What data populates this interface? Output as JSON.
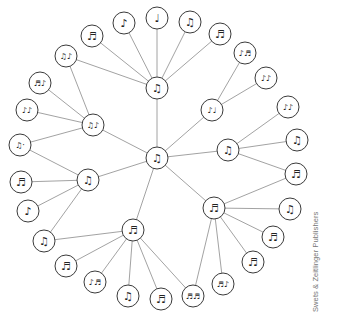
{
  "diagram": {
    "node_radius": 11,
    "colors": {
      "edge": "#8a8a8a",
      "node_stroke": "#3a3a3a",
      "node_fill": "#ffffff",
      "watermark": "#777777"
    },
    "nodes": [
      {
        "id": "C",
        "x": 157,
        "y": 158,
        "glyph": "♫",
        "role": "hub"
      },
      {
        "id": "T",
        "x": 157,
        "y": 88,
        "glyph": "♫",
        "role": "hub"
      },
      {
        "id": "L",
        "x": 93,
        "y": 125,
        "glyph": "♫♪",
        "role": "hub"
      },
      {
        "id": "LL",
        "x": 88,
        "y": 180,
        "glyph": "♫",
        "role": "hub"
      },
      {
        "id": "B",
        "x": 133,
        "y": 230,
        "glyph": "♬",
        "role": "hub"
      },
      {
        "id": "BR",
        "x": 214,
        "y": 208,
        "glyph": "♬",
        "role": "hub"
      },
      {
        "id": "R",
        "x": 228,
        "y": 150,
        "glyph": "♫",
        "role": "hub"
      },
      {
        "id": "UR",
        "x": 212,
        "y": 110,
        "glyph": "♪♩",
        "role": "hub"
      },
      {
        "id": "t1",
        "x": 92,
        "y": 36,
        "glyph": "♬",
        "role": "leaf"
      },
      {
        "id": "t2",
        "x": 124,
        "y": 23,
        "glyph": "♪",
        "role": "leaf"
      },
      {
        "id": "t3",
        "x": 157,
        "y": 18,
        "glyph": "♩",
        "role": "leaf"
      },
      {
        "id": "t4",
        "x": 190,
        "y": 22,
        "glyph": "♫",
        "role": "leaf"
      },
      {
        "id": "t5",
        "x": 220,
        "y": 34,
        "glyph": "♬",
        "role": "leaf"
      },
      {
        "id": "tl",
        "x": 66,
        "y": 56,
        "glyph": "♫♪",
        "role": "leaf"
      },
      {
        "id": "l1",
        "x": 40,
        "y": 83,
        "glyph": "♬♪",
        "role": "leaf"
      },
      {
        "id": "l2",
        "x": 27,
        "y": 110,
        "glyph": "♪♪",
        "role": "leaf"
      },
      {
        "id": "l3",
        "x": 20,
        "y": 145,
        "glyph": "♫·",
        "role": "leaf"
      },
      {
        "id": "ll1",
        "x": 21,
        "y": 182,
        "glyph": "♬",
        "role": "leaf"
      },
      {
        "id": "ll2",
        "x": 28,
        "y": 211,
        "glyph": "♪",
        "role": "leaf"
      },
      {
        "id": "bl",
        "x": 44,
        "y": 241,
        "glyph": "♫",
        "role": "leaf"
      },
      {
        "id": "b1",
        "x": 66,
        "y": 266,
        "glyph": "♬",
        "role": "leaf"
      },
      {
        "id": "b2",
        "x": 95,
        "y": 282,
        "glyph": "♪♬",
        "role": "leaf"
      },
      {
        "id": "b3",
        "x": 128,
        "y": 296,
        "glyph": "♫",
        "role": "leaf"
      },
      {
        "id": "b4",
        "x": 161,
        "y": 299,
        "glyph": "♬",
        "role": "leaf"
      },
      {
        "id": "bb",
        "x": 193,
        "y": 296,
        "glyph": "♬♬",
        "role": "leaf"
      },
      {
        "id": "br1",
        "x": 223,
        "y": 284,
        "glyph": "♬♪",
        "role": "leaf"
      },
      {
        "id": "br2",
        "x": 253,
        "y": 262,
        "glyph": "♬",
        "role": "leaf"
      },
      {
        "id": "br3",
        "x": 273,
        "y": 237,
        "glyph": "♬",
        "role": "leaf"
      },
      {
        "id": "br4",
        "x": 290,
        "y": 209,
        "glyph": "♫",
        "role": "leaf"
      },
      {
        "id": "rr",
        "x": 296,
        "y": 174,
        "glyph": "♬",
        "role": "leaf"
      },
      {
        "id": "r1",
        "x": 297,
        "y": 140,
        "glyph": "♫",
        "role": "leaf"
      },
      {
        "id": "r2",
        "x": 288,
        "y": 107,
        "glyph": "♪♪",
        "role": "leaf"
      },
      {
        "id": "ur1",
        "x": 266,
        "y": 78,
        "glyph": "♪♪",
        "role": "leaf"
      },
      {
        "id": "ur2",
        "x": 245,
        "y": 53,
        "glyph": "♪♬",
        "role": "leaf"
      }
    ],
    "edges": [
      [
        "C",
        "T"
      ],
      [
        "C",
        "L"
      ],
      [
        "C",
        "LL"
      ],
      [
        "C",
        "B"
      ],
      [
        "C",
        "BR"
      ],
      [
        "C",
        "R"
      ],
      [
        "C",
        "UR"
      ],
      [
        "T",
        "t1"
      ],
      [
        "T",
        "t2"
      ],
      [
        "T",
        "t3"
      ],
      [
        "T",
        "t4"
      ],
      [
        "T",
        "t5"
      ],
      [
        "T",
        "tl"
      ],
      [
        "L",
        "tl"
      ],
      [
        "L",
        "l1"
      ],
      [
        "L",
        "l2"
      ],
      [
        "L",
        "l3"
      ],
      [
        "LL",
        "l3"
      ],
      [
        "LL",
        "ll1"
      ],
      [
        "LL",
        "ll2"
      ],
      [
        "LL",
        "bl"
      ],
      [
        "B",
        "bl"
      ],
      [
        "B",
        "b1"
      ],
      [
        "B",
        "b2"
      ],
      [
        "B",
        "b3"
      ],
      [
        "B",
        "b4"
      ],
      [
        "B",
        "bb"
      ],
      [
        "BR",
        "bb"
      ],
      [
        "BR",
        "br1"
      ],
      [
        "BR",
        "br2"
      ],
      [
        "BR",
        "br3"
      ],
      [
        "BR",
        "br4"
      ],
      [
        "BR",
        "rr"
      ],
      [
        "R",
        "rr"
      ],
      [
        "R",
        "r1"
      ],
      [
        "R",
        "r2"
      ],
      [
        "UR",
        "ur1"
      ],
      [
        "UR",
        "ur2"
      ]
    ]
  },
  "watermark": {
    "text": "Swets & Zeitlinger Publishers"
  }
}
